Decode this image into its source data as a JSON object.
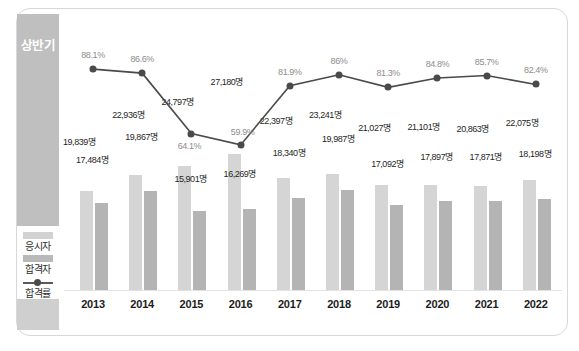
{
  "banner": {
    "label": "상반기"
  },
  "legend": {
    "items": [
      {
        "label": "응시자",
        "type": "bar",
        "color": "#d5d5d5"
      },
      {
        "label": "합격자",
        "type": "bar",
        "color": "#b4b4b4"
      },
      {
        "label": "합격률",
        "type": "line",
        "color": "#4a4a4a"
      }
    ]
  },
  "chart_data": {
    "type": "bar",
    "title": "",
    "xlabel": "",
    "ylabel": "",
    "grid": false,
    "legend_position": "left",
    "categories": [
      "2013",
      "2014",
      "2015",
      "2016",
      "2017",
      "2018",
      "2019",
      "2020",
      "2021",
      "2022"
    ],
    "series": [
      {
        "name": "응시자",
        "type": "bar",
        "color": "#d5d5d5",
        "values": [
          19839,
          22936,
          24797,
          27180,
          22397,
          23241,
          21027,
          21101,
          20863,
          22075
        ],
        "labels": [
          "19,839명",
          "22,936명",
          "24,797명",
          "27,180명",
          "22,397명",
          "23,241명",
          "21,027명",
          "21,101명",
          "20,863명",
          "22,075명"
        ]
      },
      {
        "name": "합격자",
        "type": "bar",
        "color": "#b4b4b4",
        "values": [
          17484,
          19867,
          15901,
          16269,
          18340,
          19987,
          17092,
          17897,
          17871,
          18198
        ],
        "labels": [
          "17,484명",
          "19,867명",
          "15,901명",
          "16,269명",
          "18,340명",
          "19,987명",
          "17,092명",
          "17,897명",
          "17,871명",
          "18,198명"
        ]
      },
      {
        "name": "합격률",
        "type": "line",
        "color": "#4a4a4a",
        "values": [
          88.1,
          86.6,
          64.1,
          59.9,
          81.9,
          86.0,
          81.3,
          84.8,
          85.7,
          82.4
        ],
        "labels": [
          "88.1%",
          "86.6%",
          "64.1%",
          "59.9%",
          "81.9%",
          "86%",
          "81.3%",
          "84.8%",
          "85.7%",
          "82.4%"
        ]
      }
    ],
    "ylim_bar": [
      0,
      30000
    ],
    "ylim_rate": [
      0,
      100
    ]
  },
  "layout": {
    "bar_value_offsets_applicants": [
      {
        "x": 1,
        "y": 128
      },
      {
        "x": 1,
        "y": 101
      },
      {
        "x": 1,
        "y": 88
      },
      {
        "x": 1,
        "y": 68
      },
      {
        "x": 1,
        "y": 107
      },
      {
        "x": 1,
        "y": 101
      },
      {
        "x": 1,
        "y": 114
      },
      {
        "x": 1,
        "y": 113
      },
      {
        "x": 1,
        "y": 115
      },
      {
        "x": 1,
        "y": 109
      }
    ],
    "bar_value_offsets_passers": [
      {
        "x": 14,
        "y": 146
      },
      {
        "x": 14,
        "y": 123
      },
      {
        "x": 14,
        "y": 165
      },
      {
        "x": 14,
        "y": 160
      },
      {
        "x": 14,
        "y": 139
      },
      {
        "x": 14,
        "y": 125
      },
      {
        "x": 14,
        "y": 150
      },
      {
        "x": 14,
        "y": 143
      },
      {
        "x": 14,
        "y": 143
      },
      {
        "x": 14,
        "y": 140
      }
    ],
    "rate_label_offsets": [
      {
        "dx": 0,
        "dy": -14
      },
      {
        "dx": 0,
        "dy": -14
      },
      {
        "dx": -2,
        "dy": 12
      },
      {
        "dx": 2,
        "dy": -13
      },
      {
        "dx": 0,
        "dy": -14
      },
      {
        "dx": 0,
        "dy": -14
      },
      {
        "dx": 0,
        "dy": -14
      },
      {
        "dx": 0,
        "dy": -14
      },
      {
        "dx": 0,
        "dy": -14
      },
      {
        "dx": 0,
        "dy": -14
      }
    ]
  }
}
